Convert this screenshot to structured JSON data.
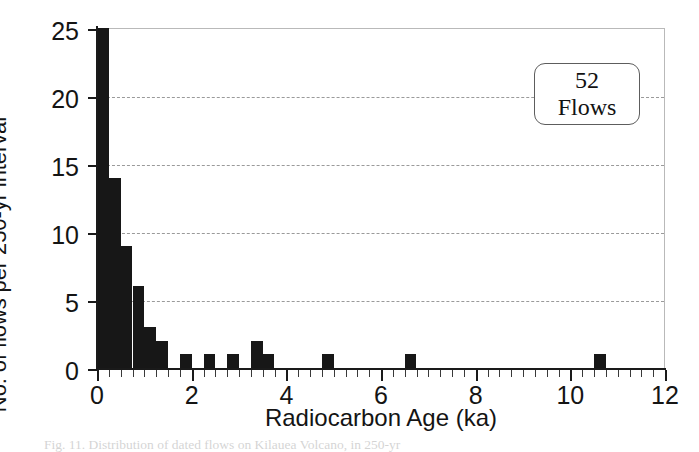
{
  "chart_data": {
    "type": "bar",
    "title": "",
    "xlabel": "Radiocarbon Age (ka)",
    "ylabel": "No. of flows per 250-yr interval",
    "xlim": [
      0,
      12
    ],
    "ylim": [
      0,
      25
    ],
    "xticks": [
      0,
      2,
      4,
      6,
      8,
      10,
      12
    ],
    "xticklabels": [
      "0",
      "2",
      "4",
      "6",
      "8",
      "10",
      "12"
    ],
    "yticks": [
      0,
      5,
      10,
      15,
      20,
      25
    ],
    "yticklabels": [
      "0",
      "5",
      "10",
      "15",
      "20",
      "25"
    ],
    "x_minor_tick_step": 0.25,
    "grid": "horizontal-dashed",
    "legend": "none",
    "bar_width_ka": 0.25,
    "bin_width_years": 250,
    "x": [
      0.125,
      0.375,
      0.625,
      0.875,
      1.125,
      1.375,
      1.875,
      2.375,
      2.875,
      3.375,
      3.625,
      4.875,
      6.625,
      10.625
    ],
    "values": [
      25,
      14,
      9,
      6,
      3,
      2,
      1,
      1,
      1,
      2,
      1,
      1,
      1,
      1
    ],
    "note": "First bar is clipped by the axis top; plotted value is at or above 25.",
    "annotation": {
      "line1": "52",
      "line2": "Flows"
    }
  },
  "caption": {
    "text": "Fig. 11.   Distribution of dated flows on Kilauea Volcano, in 250-yr"
  }
}
